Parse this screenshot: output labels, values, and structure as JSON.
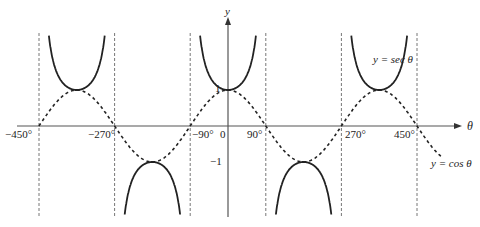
{
  "chart_data": {
    "type": "line",
    "title": "",
    "xlabel": "θ",
    "ylabel": "y",
    "xlim": [
      -510,
      540
    ],
    "ylim": [
      -2.5,
      3
    ],
    "grid": false,
    "x_ticks": [
      {
        "value": -450,
        "label": "−450°"
      },
      {
        "value": -270,
        "label": "−270°"
      },
      {
        "value": -90,
        "label": "−90°"
      },
      {
        "value": 0,
        "label": "0"
      },
      {
        "value": 90,
        "label": "90°"
      },
      {
        "value": 270,
        "label": "270°"
      },
      {
        "value": 450,
        "label": "450°"
      }
    ],
    "y_ticks": [
      {
        "value": 1,
        "label": "1"
      },
      {
        "value": -1,
        "label": "−1"
      }
    ],
    "asymptotes": [
      -450,
      -270,
      -90,
      90,
      270,
      450
    ],
    "series": [
      {
        "name": "y = sec θ",
        "style": "solid",
        "function": "sec",
        "label": "y = sec θ"
      },
      {
        "name": "y = cos θ",
        "style": "dashed",
        "function": "cos",
        "label": "y = cos θ"
      }
    ],
    "key_points": {
      "sec_minima": [
        {
          "x": -360,
          "y": 1
        },
        {
          "x": 0,
          "y": 1
        },
        {
          "x": 360,
          "y": 1
        }
      ],
      "sec_maxima": [
        {
          "x": -180,
          "y": -1
        },
        {
          "x": 180,
          "y": -1
        }
      ],
      "cos_zeros": [
        -450,
        -270,
        -90,
        90,
        270,
        450
      ]
    },
    "legend": "inline annotations"
  },
  "labels": {
    "y_axis": "y",
    "x_axis": "θ",
    "origin": "0",
    "one": "1",
    "minus_one": "−1",
    "sec_label": "y = sec θ",
    "cos_label": "y = cos θ",
    "tick_m450": "−450°",
    "tick_m270": "−270°",
    "tick_m90": "−90°",
    "tick_90": "90°",
    "tick_270": "270°",
    "tick_450": "450°"
  }
}
